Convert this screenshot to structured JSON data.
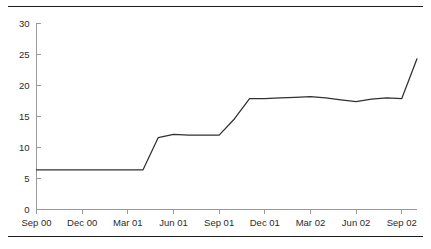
{
  "figure": {
    "top_rule": "horizontal-rule",
    "bottom_rule": "horizontal-rule"
  },
  "chart_data": {
    "type": "line",
    "title": "",
    "subtitle": "",
    "xlabel": "",
    "ylabel": "",
    "ylim": [
      0,
      30
    ],
    "yticks": [
      0,
      5,
      10,
      15,
      20,
      25,
      30
    ],
    "ytick_labels": [
      "0",
      "5",
      "10",
      "15",
      "20",
      "25",
      "30"
    ],
    "xtick_labels": [
      "Sep 00",
      "Dec 00",
      "Mar 01",
      "Jun 01",
      "Sep 01",
      "Dec 01",
      "Mar 02",
      "Jun 02",
      "Sep 02"
    ],
    "grid": false,
    "legend": null,
    "legend_position": "none",
    "line_color": "#303030",
    "axis_color": "#9a9a9a",
    "x": [
      "Sep 00",
      "Oct 00",
      "Nov 00",
      "Dec 00",
      "Jan 01",
      "Feb 01",
      "Mar 01",
      "Apr 01",
      "May 01",
      "Jun 01",
      "Jul 01",
      "Aug 01",
      "Sep 01",
      "Oct 01",
      "Nov 01",
      "Dec 01",
      "Jan 02",
      "Feb 02",
      "Mar 02",
      "Apr 02",
      "May 02",
      "Jun 02",
      "Jul 02",
      "Aug 02",
      "Sep 02",
      "Oct 02"
    ],
    "values": [
      6.4,
      6.4,
      6.4,
      6.4,
      6.4,
      6.4,
      6.4,
      6.4,
      11.6,
      12.1,
      12.0,
      12.0,
      12.0,
      14.6,
      17.9,
      17.9,
      18.0,
      18.1,
      18.2,
      18.0,
      17.7,
      17.4,
      17.8,
      18.0,
      17.9,
      24.3
    ],
    "series": [
      {
        "name": "series-1",
        "values": [
          6.4,
          6.4,
          6.4,
          6.4,
          6.4,
          6.4,
          6.4,
          6.4,
          11.6,
          12.1,
          12.0,
          12.0,
          12.0,
          14.6,
          17.9,
          17.9,
          18.0,
          18.1,
          18.2,
          18.0,
          17.7,
          17.4,
          17.8,
          18.0,
          17.9,
          24.3
        ]
      }
    ]
  }
}
